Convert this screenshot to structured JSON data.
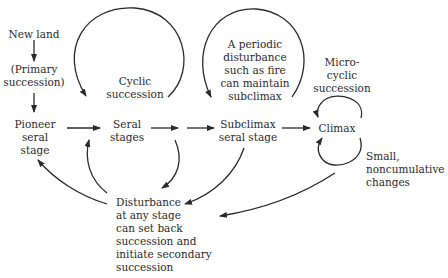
{
  "diagram": {
    "type": "ecological-succession-flowchart",
    "nodes": {
      "new_land": {
        "lines": [
          "New land"
        ]
      },
      "primary_succession": {
        "lines": [
          "(Primary",
          "succession)"
        ]
      },
      "pioneer": {
        "lines": [
          "Pioneer",
          "seral",
          "stage"
        ]
      },
      "seral_stages": {
        "lines": [
          "Seral",
          "stages"
        ]
      },
      "subclimax": {
        "lines": [
          "Subclimax",
          "seral stage"
        ]
      },
      "climax": {
        "lines": [
          "Climax"
        ]
      },
      "cyclic": {
        "lines": [
          "Cyclic",
          "succession"
        ]
      },
      "periodic": {
        "lines": [
          "A periodic",
          "disturbance",
          "such as fire",
          "can maintain",
          "subclimax"
        ]
      },
      "microcyclic": {
        "lines": [
          "Micro-",
          "cyclic",
          "succession"
        ]
      },
      "small_changes": {
        "lines": [
          "Small,",
          "noncumulative",
          "changes"
        ]
      },
      "disturbance": {
        "lines": [
          "Disturbance",
          "at any stage",
          "can set back",
          "succession and",
          "initiate secondary",
          "succession"
        ]
      }
    },
    "edges": [
      {
        "from": "new_land",
        "to": "primary_succession"
      },
      {
        "from": "primary_succession",
        "to": "pioneer"
      },
      {
        "from": "pioneer",
        "to": "seral_stages"
      },
      {
        "from": "seral_stages",
        "to": "subclimax"
      },
      {
        "from": "subclimax",
        "to": "climax"
      },
      {
        "from": "seral_stages",
        "to": "seral_stages",
        "label": "cyclic"
      },
      {
        "from": "subclimax",
        "to": "subclimax",
        "label": "periodic"
      },
      {
        "from": "climax",
        "to": "climax",
        "label": "microcyclic"
      },
      {
        "from": "seral_stages",
        "to": "disturbance"
      },
      {
        "from": "subclimax",
        "to": "disturbance"
      },
      {
        "from": "climax",
        "to": "disturbance"
      },
      {
        "from": "disturbance",
        "to": "pioneer"
      },
      {
        "from": "disturbance",
        "to": "seral_stages"
      }
    ],
    "colors": {
      "ink": "#2a2a2a",
      "background": "#ffffff"
    }
  }
}
